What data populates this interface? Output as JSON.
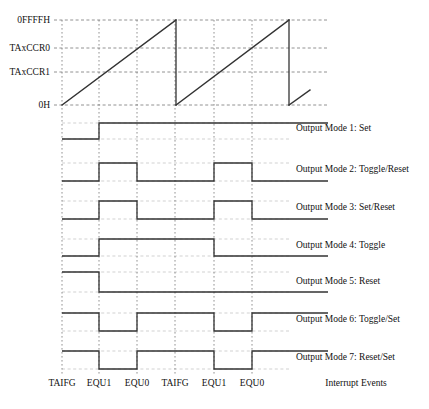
{
  "diagram": {
    "colors": {
      "line": "#333333",
      "grid": "#777777",
      "background": "#ffffff",
      "text": "#111111"
    },
    "y_axis": {
      "labels": [
        {
          "text": "0FFFFH",
          "y": 20
        },
        {
          "text": "TAxCCR0",
          "y": 48
        },
        {
          "text": "TAxCCR1",
          "y": 72
        },
        {
          "text": "0H",
          "y": 105
        }
      ]
    },
    "x_axis": {
      "gridlines": [
        62,
        99,
        137,
        175,
        214,
        252
      ],
      "event_labels": [
        "TAIFG",
        "EQU1",
        "EQU0",
        "TAIFG",
        "EQU1",
        "EQU0"
      ],
      "events_title": "Interrupt Events"
    },
    "ramp": {
      "description": "Up-mode counter sawtooth from 0H to 0FFFFH",
      "segments": [
        {
          "x1": 62,
          "y1": 105,
          "x2": 176,
          "y2": 20
        },
        {
          "x1": 176,
          "y1": 20,
          "x2": 176,
          "y2": 105
        },
        {
          "x1": 176,
          "y1": 105,
          "x2": 289,
          "y2": 20
        },
        {
          "x1": 289,
          "y1": 20,
          "x2": 289,
          "y2": 105
        },
        {
          "x1": 289,
          "y1": 105,
          "x2": 310,
          "y2": 90
        }
      ]
    },
    "modes": [
      {
        "label": "Output Mode 1: Set",
        "name": "output-mode-1",
        "high_y": 123,
        "low_y": 139,
        "start_level": "low",
        "transitions": [
          99
        ],
        "label_y": 131
      },
      {
        "label": "Output Mode 2: Toggle/Reset",
        "name": "output-mode-2",
        "high_y": 163,
        "low_y": 181,
        "start_level": "low",
        "transitions": [
          99,
          137,
          214,
          252
        ],
        "label_y": 172
      },
      {
        "label": "Output Mode 3: Set/Reset",
        "name": "output-mode-3",
        "high_y": 201,
        "low_y": 219,
        "start_level": "low",
        "transitions": [
          99,
          137,
          214,
          252
        ],
        "label_y": 210
      },
      {
        "label": "Output Mode 4: Toggle",
        "name": "output-mode-4",
        "high_y": 239,
        "low_y": 256,
        "start_level": "low",
        "transitions": [
          99,
          214
        ],
        "label_y": 248
      },
      {
        "label": "Output Mode 5: Reset",
        "name": "output-mode-5",
        "high_y": 272,
        "low_y": 292,
        "start_level": "high",
        "transitions": [
          99
        ],
        "label_y": 284
      },
      {
        "label": "Output Mode 6: Toggle/Set",
        "name": "output-mode-6",
        "high_y": 313,
        "low_y": 331,
        "start_level": "high",
        "transitions": [
          99,
          137,
          214,
          252
        ],
        "label_y": 322
      },
      {
        "label": "Output Mode 7: Reset/Set",
        "name": "output-mode-7",
        "high_y": 351,
        "low_y": 369,
        "start_level": "high",
        "transitions": [
          99,
          137,
          214,
          252
        ],
        "label_y": 360
      }
    ],
    "geometry": {
      "plot_left": 62,
      "plot_right": 290,
      "line_right": 328,
      "grid_top": 20,
      "grid_bottom": 375,
      "label_x": 296,
      "events_title_x": 356,
      "events_label_y": 386
    }
  }
}
